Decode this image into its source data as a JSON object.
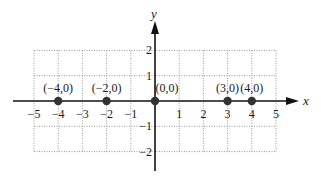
{
  "chart_data": {
    "type": "scatter",
    "title": "",
    "xlabel": "x",
    "ylabel": "y",
    "xlim": [
      -5,
      5
    ],
    "ylim": [
      -2,
      2
    ],
    "grid": true,
    "grid_style": "dotted",
    "x_ticks": [
      -5,
      -4,
      -3,
      -2,
      -1,
      1,
      2,
      3,
      4,
      5
    ],
    "x_tick_labels": [
      "−5",
      "−4",
      "−3",
      "−2",
      "−1",
      "1",
      "2",
      "3",
      "4",
      "5"
    ],
    "y_ticks": [
      2,
      1,
      -1,
      -2
    ],
    "y_tick_labels": [
      "2",
      "1",
      "−1",
      "−2"
    ],
    "series": [
      {
        "name": "points",
        "points": [
          {
            "x": -4,
            "y": 0,
            "label": "(−4,0)"
          },
          {
            "x": -2,
            "y": 0,
            "label": "(−2,0)"
          },
          {
            "x": 0,
            "y": 0,
            "label": "(0,0)"
          },
          {
            "x": 3,
            "y": 0,
            "label": "(3,0)"
          },
          {
            "x": 4,
            "y": 0,
            "label": "(4,0)"
          }
        ]
      }
    ]
  },
  "colors": {
    "axis": "#111111",
    "grid": "#9a9a9a",
    "point": "#333333"
  }
}
